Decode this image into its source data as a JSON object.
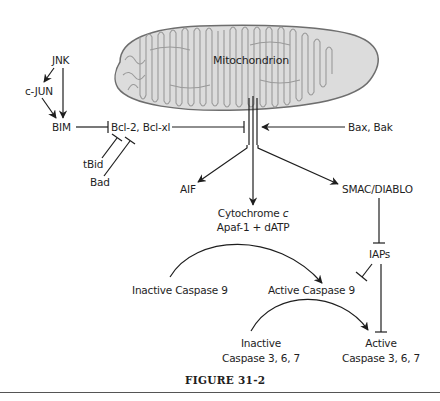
{
  "figure": {
    "caption": "FIGURE 31-2",
    "organelle_label": "Mitochondrion"
  },
  "nodes": {
    "jnk": "JNK",
    "cjun": "c-JUN",
    "bim": "BIM",
    "bcl2": "Bcl-2, Bcl-xl",
    "tbid": "tBid",
    "bad": "Bad",
    "baxbak": "Bax, Bak",
    "aif": "AIF",
    "cytc_prefix": "Cytochrome ",
    "cytc_italic": "c",
    "apaf": "Apaf-1 + dATP",
    "smac": "SMAC/DIABLO",
    "iaps": "IAPs",
    "inactive_casp9": "Inactive Caspase 9",
    "active_casp9": "Active Caspase 9",
    "inactive_casp367_l1": "Inactive",
    "inactive_casp367_l2": "Caspase 3, 6, 7",
    "active_casp367_l1": "Active",
    "active_casp367_l2": "Caspase 3, 6, 7"
  },
  "edges": [
    {
      "from": "JNK",
      "to": "c-JUN",
      "type": "activation"
    },
    {
      "from": "JNK",
      "to": "BIM",
      "type": "activation"
    },
    {
      "from": "c-JUN",
      "to": "BIM",
      "type": "activation"
    },
    {
      "from": "BIM",
      "to": "Bcl-2, Bcl-xl",
      "type": "inhibition"
    },
    {
      "from": "tBid",
      "to": "Bcl-2, Bcl-xl",
      "type": "inhibition"
    },
    {
      "from": "Bad",
      "to": "Bcl-2, Bcl-xl",
      "type": "inhibition"
    },
    {
      "from": "Bcl-2, Bcl-xl",
      "to": "Mitochondrion",
      "type": "inhibition"
    },
    {
      "from": "Bax, Bak",
      "to": "Mitochondrion",
      "type": "activation"
    },
    {
      "from": "Mitochondrion",
      "to": "AIF",
      "type": "activation"
    },
    {
      "from": "Mitochondrion",
      "to": "Cytochrome c",
      "type": "activation"
    },
    {
      "from": "Mitochondrion",
      "to": "SMAC/DIABLO",
      "type": "activation"
    },
    {
      "from": "SMAC/DIABLO",
      "to": "IAPs",
      "type": "inhibition"
    },
    {
      "from": "IAPs",
      "to": "Active Caspase 9",
      "type": "inhibition"
    },
    {
      "from": "IAPs",
      "to": "Active Caspase 3, 6, 7",
      "type": "inhibition"
    },
    {
      "from": "Inactive Caspase 9",
      "to": "Active Caspase 9",
      "type": "conversion"
    },
    {
      "from": "Inactive Caspase 3, 6, 7",
      "to": "Active Caspase 3, 6, 7",
      "type": "conversion"
    }
  ],
  "colors": {
    "line": "#1e1e1e",
    "mito_fill": "#dcdcdc",
    "mito_stroke": "#6e6e6e",
    "cristae": "#9a9a9a",
    "rule": "#555555"
  }
}
